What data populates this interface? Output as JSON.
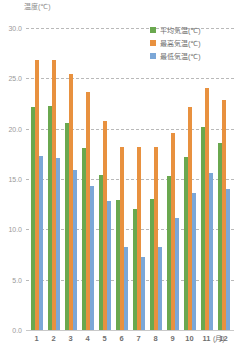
{
  "chart_data": {
    "type": "bar",
    "title": "",
    "ylabel": "温度(℃)",
    "xlabel": "(月)",
    "categories": [
      "1",
      "2",
      "3",
      "4",
      "5",
      "6",
      "7",
      "8",
      "9",
      "10",
      "11",
      "12"
    ],
    "ylim": [
      0.0,
      30.0
    ],
    "yticks": [
      "0.0",
      "5.0",
      "10.0",
      "15.0",
      "20.0",
      "25.0",
      "30.0"
    ],
    "ytick_values": [
      0.0,
      5.0,
      10.0,
      15.0,
      20.0,
      25.0,
      30.0
    ],
    "grid": true,
    "legend_position": "top-right",
    "series": [
      {
        "name": "平均気温(℃)",
        "color": "#6aa84f",
        "values": [
          22.2,
          22.3,
          20.6,
          18.1,
          15.4,
          12.9,
          12.0,
          13.0,
          15.3,
          17.2,
          20.2,
          18.6
        ]
      },
      {
        "name": "最高気温(℃)",
        "color": "#e8913f",
        "values": [
          26.8,
          26.8,
          25.4,
          23.6,
          20.8,
          18.2,
          18.2,
          18.2,
          19.6,
          22.2,
          24.0,
          22.8
        ]
      },
      {
        "name": "最低気温(℃)",
        "color": "#7ba7d7",
        "values": [
          17.3,
          17.1,
          15.9,
          14.3,
          12.8,
          8.2,
          7.3,
          8.2,
          11.1,
          13.6,
          15.6,
          14.0
        ]
      }
    ]
  },
  "legend": {
    "items": [
      {
        "label": "平均気温(℃)",
        "color": "#6aa84f"
      },
      {
        "label": "最高気温(℃)",
        "color": "#e8913f"
      },
      {
        "label": "最低気温(℃)",
        "color": "#7ba7d7"
      }
    ]
  }
}
